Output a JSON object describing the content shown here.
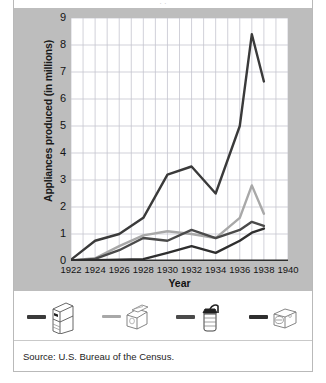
{
  "figure": {
    "top_cut_text": "·                              ·",
    "source": "Source: U.S. Bureau of the Census."
  },
  "chart_data": {
    "type": "line",
    "title": "",
    "xlabel": "Year",
    "ylabel": "Appliances produced (in millions)",
    "xlim": [
      1922,
      1940
    ],
    "ylim": [
      0,
      9
    ],
    "xticks": [
      1922,
      1924,
      1926,
      1928,
      1930,
      1932,
      1934,
      1936,
      1938,
      1940
    ],
    "yticks": [
      0,
      1,
      2,
      3,
      4,
      5,
      6,
      7,
      8,
      9
    ],
    "grid": true,
    "grid_x_step": 1,
    "grid_y_step": 1,
    "legend_position": "bottom",
    "x": [
      1922,
      1924,
      1926,
      1928,
      1930,
      1932,
      1934,
      1936,
      1937,
      1938
    ],
    "series": [
      {
        "name": "refrigerators",
        "icon": "refrigerator-icon",
        "color": "#3a3a3a",
        "values": [
          0.05,
          0.75,
          1.0,
          1.6,
          3.2,
          3.5,
          2.5,
          5.0,
          8.4,
          6.65
        ]
      },
      {
        "name": "washing-machines",
        "icon": "washing-machine-icon",
        "color": "#a8a8a8",
        "values": [
          0.02,
          0.1,
          0.55,
          0.95,
          1.1,
          1.0,
          0.85,
          1.6,
          2.8,
          1.75
        ]
      },
      {
        "name": "mixers",
        "icon": "mixer-icon",
        "color": "#4a4a4a",
        "values": [
          0.02,
          0.08,
          0.4,
          0.85,
          0.75,
          1.15,
          0.85,
          1.15,
          1.45,
          1.3
        ]
      },
      {
        "name": "vacuum-cleaners",
        "icon": "vacuum-cleaner-icon",
        "color": "#2e2e2e",
        "values": [
          0.02,
          0.03,
          0.05,
          0.07,
          0.3,
          0.55,
          0.3,
          0.75,
          1.05,
          1.2
        ]
      }
    ]
  },
  "colors": {
    "panel_background": "#bdbdbd",
    "plot_background": "#ffffff",
    "grid": "#c5c5cf",
    "frame": "#b9b9b9"
  }
}
